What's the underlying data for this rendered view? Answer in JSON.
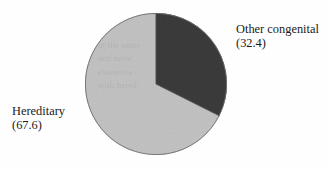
{
  "figure": {
    "background_color": "#ffffff",
    "ink_color": "#1b1b1b"
  },
  "chart_data": {
    "type": "pie",
    "title": "",
    "subtitle": "",
    "xlabel": "",
    "ylabel": "",
    "legend_position": "none",
    "grid": false,
    "units": "percent",
    "start_angle_deg": 0,
    "direction": "clockwise",
    "categories": [
      "Other congenital",
      "Hereditary"
    ],
    "values": [
      32.4,
      67.6
    ],
    "slices": [
      {
        "name": "Other congenital",
        "value": 32.4,
        "value_label": "(32.4)",
        "color": "#3d3d3d",
        "angle_deg": 116.6,
        "start_deg": 0,
        "end_deg": 116.6,
        "label_position": "right"
      },
      {
        "name": "Hereditary",
        "value": 67.6,
        "value_label": "(67.6)",
        "color": "#c4c4c4",
        "angle_deg": 243.4,
        "start_deg": 116.6,
        "end_deg": 360,
        "label_position": "left"
      }
    ],
    "annotations": []
  },
  "labels": {
    "other_congenital": {
      "name": "Other congenital",
      "value": "(32.4)"
    },
    "hereditary": {
      "name": "Hereditary",
      "value": "(67.6)"
    }
  },
  "artifacts": {
    "show_through_text": "of the same\nand more\nextensive\nwith hered"
  }
}
